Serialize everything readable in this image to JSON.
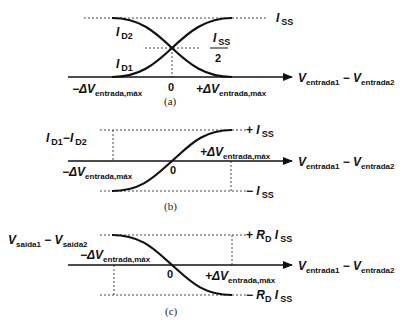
{
  "panels": [
    {
      "id": "a",
      "caption": "(a)",
      "x_axis_label": {
        "v": "V",
        "sub1": "entrada1",
        "minus": " − ",
        "v2": "V",
        "sub2": "entrada2"
      },
      "labels": {
        "top_level": {
          "i": "I",
          "sub": "SS"
        },
        "half_level": {
          "i": "I",
          "sub": "SS",
          "den": "2"
        },
        "curve_decreasing": {
          "i": "I",
          "sub": "D2"
        },
        "curve_increasing": {
          "i": "I",
          "sub": "D1"
        },
        "neg_limit": {
          "prefix": "−ΔV",
          "sub": "entrada,máx"
        },
        "pos_limit": {
          "prefix": "+ΔV",
          "sub": "entrada,máx"
        },
        "origin": "0"
      }
    },
    {
      "id": "b",
      "caption": "(b)",
      "y_axis_label": {
        "i1": "I",
        "sub1": "D1",
        "minus": "−",
        "i2": "I",
        "sub2": "D2"
      },
      "x_axis_label": {
        "v": "V",
        "sub1": "entrada1",
        "minus": " − ",
        "v2": "V",
        "sub2": "entrada2"
      },
      "labels": {
        "top_level": {
          "sign": "+ ",
          "i": "I",
          "sub": "SS"
        },
        "bottom_level": {
          "sign": "− ",
          "i": "I",
          "sub": "SS"
        },
        "neg_limit": {
          "prefix": "−ΔV",
          "sub": "entrada,máx"
        },
        "pos_limit": {
          "prefix": "+ΔV",
          "sub": "entrada,máx"
        },
        "origin": "0"
      }
    },
    {
      "id": "c",
      "caption": "(c)",
      "y_axis_label": {
        "v1": "V",
        "sub1": "saída1",
        "minus": " − ",
        "v2": "V",
        "sub2": "saída2"
      },
      "x_axis_label": {
        "v": "V",
        "sub1": "entrada1",
        "minus": " − ",
        "v2": "V",
        "sub2": "entrada2"
      },
      "labels": {
        "top_level": {
          "sign": "+ ",
          "r": "R",
          "rsub": "D",
          "i": " I",
          "sub": "SS"
        },
        "bottom_level": {
          "sign": "− ",
          "r": "R",
          "rsub": "D",
          "i": " I",
          "sub": "SS"
        },
        "neg_limit": {
          "prefix": "−ΔV",
          "sub": "entrada,máx"
        },
        "pos_limit": {
          "prefix": "+ΔV",
          "sub": "entrada,máx"
        },
        "origin": "0"
      }
    }
  ]
}
